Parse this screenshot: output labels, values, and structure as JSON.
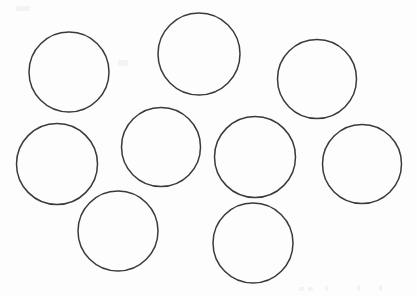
{
  "canvas": {
    "width": 417,
    "height": 296,
    "background_color": "#fdfdfd",
    "title": "Hand-drawn circles worksheet"
  },
  "style": {
    "stroke_color": "#3a3a3a",
    "stroke_width": 1.5,
    "fill_color": "none",
    "artifact_color": "#f3f3f3"
  },
  "shapes": {
    "type": "circle",
    "count": 9,
    "items": [
      {
        "name": "circle-top-left",
        "label": "1",
        "cx": 69,
        "cy": 72,
        "r": 40.0
      },
      {
        "name": "circle-top-center",
        "label": "2",
        "cx": 199,
        "cy": 54,
        "r": 41.0
      },
      {
        "name": "circle-top-right",
        "label": "3",
        "cx": 317,
        "cy": 79,
        "r": 39.5
      },
      {
        "name": "circle-middle-left",
        "label": "4",
        "cx": 57,
        "cy": 164,
        "r": 40.5
      },
      {
        "name": "circle-middle-center",
        "label": "5",
        "cx": 161,
        "cy": 147,
        "r": 39.5
      },
      {
        "name": "circle-middle-right",
        "label": "6",
        "cx": 255,
        "cy": 157,
        "r": 40.5
      },
      {
        "name": "circle-far-right",
        "label": "7",
        "cx": 362,
        "cy": 164,
        "r": 39.5
      },
      {
        "name": "circle-bottom-left",
        "label": "8",
        "cx": 118,
        "cy": 231,
        "r": 40.0
      },
      {
        "name": "circle-bottom-center",
        "label": "9",
        "cx": 253,
        "cy": 243,
        "r": 40.0
      }
    ]
  },
  "scan_artifacts": [
    {
      "name": "artifact-bottom-right-1",
      "x": 299,
      "y": 287,
      "w": 5,
      "h": 4
    },
    {
      "name": "artifact-bottom-right-2",
      "x": 308,
      "y": 287,
      "w": 5,
      "h": 4
    },
    {
      "name": "artifact-bottom-right-3",
      "x": 325,
      "y": 286,
      "w": 3,
      "h": 5
    },
    {
      "name": "artifact-bottom-right-4",
      "x": 357,
      "y": 285,
      "w": 3,
      "h": 6
    },
    {
      "name": "artifact-bottom-right-5",
      "x": 379,
      "y": 285,
      "w": 3,
      "h": 6
    },
    {
      "name": "artifact-top-left-1",
      "x": 16,
      "y": 6,
      "w": 14,
      "h": 5
    },
    {
      "name": "artifact-mid-faint-1",
      "x": 118,
      "y": 60,
      "w": 10,
      "h": 6
    }
  ]
}
